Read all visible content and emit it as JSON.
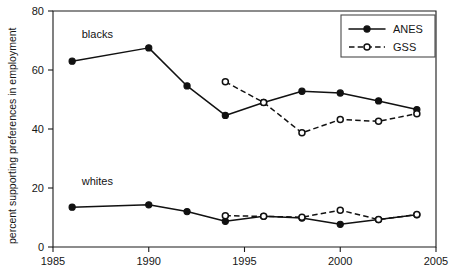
{
  "chart_data": {
    "type": "line",
    "title": "",
    "xlabel": "",
    "ylabel": "percent supporting preferences in employment",
    "xlim": [
      1985,
      2005
    ],
    "ylim": [
      0,
      80
    ],
    "xticks": [
      1985,
      1990,
      1995,
      2000,
      2005
    ],
    "yticks": [
      0,
      20,
      40,
      60,
      80
    ],
    "grid": false,
    "legend_position": "top-right",
    "legend": [
      "ANES",
      "GSS"
    ],
    "annotations": [
      {
        "text": "blacks",
        "x": 1986.5,
        "y": 71
      },
      {
        "text": "whites",
        "x": 1986.5,
        "y": 21
      }
    ],
    "series": [
      {
        "name": "blacks-ANES",
        "legend": "ANES",
        "group": "blacks",
        "style": "solid",
        "marker": "filled-circle",
        "x": [
          1986,
          1990,
          1992,
          1994,
          1996,
          1998,
          2000,
          2002,
          2004
        ],
        "values": [
          63.0,
          67.5,
          54.6,
          44.6,
          49.0,
          52.8,
          52.2,
          49.5,
          46.6
        ]
      },
      {
        "name": "blacks-GSS",
        "legend": "GSS",
        "group": "blacks",
        "style": "dashed",
        "marker": "open-circle",
        "x": [
          1994,
          1996,
          1998,
          2000,
          2002,
          2004
        ],
        "values": [
          56.0,
          49.0,
          38.7,
          43.2,
          42.6,
          45.2
        ]
      },
      {
        "name": "whites-ANES",
        "legend": "ANES",
        "group": "whites",
        "style": "solid",
        "marker": "filled-circle",
        "x": [
          1986,
          1990,
          1992,
          1994,
          1996,
          1998,
          2000,
          2002,
          2004
        ],
        "values": [
          13.5,
          14.3,
          12.0,
          8.7,
          10.4,
          9.8,
          7.7,
          9.3,
          10.9
        ]
      },
      {
        "name": "whites-GSS",
        "legend": "GSS",
        "group": "whites",
        "style": "dashed",
        "marker": "open-circle",
        "x": [
          1994,
          1996,
          1998,
          2000,
          2002,
          2004
        ],
        "values": [
          10.6,
          10.4,
          10.1,
          12.5,
          9.3,
          11.0
        ]
      }
    ]
  }
}
